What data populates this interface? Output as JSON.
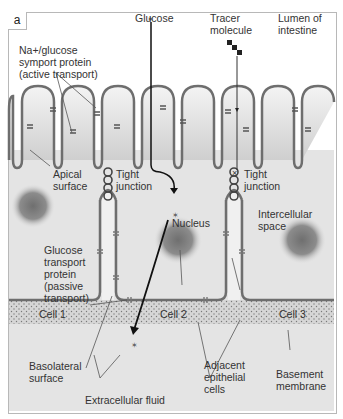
{
  "figure": {
    "panel_label": "a",
    "labels": {
      "symport": "Na+/glucose\nsymport protein\n(active transport)",
      "glucose_top": "Glucose",
      "tracer": "Tracer\nmolecule",
      "lumen": "Lumen of\nintestine",
      "apical": "Apical\nsurface",
      "tight_junction_1": "Tight\njunction",
      "tight_junction_2": "Tight\njunction",
      "nucleus": "Nucleus",
      "intercellular": "Intercellular\nspace",
      "glucose_transport": "Glucose\ntransport\nprotein\n(passive\ntransport)",
      "cell1": "Cell 1",
      "cell2": "Cell 2",
      "cell3": "Cell 3",
      "basolateral": "Basolateral\nsurface",
      "adjacent": "Adjacent\nepithelial\ncells",
      "basement": "Basement\nmembrane",
      "extracellular": "Extracellular fluid"
    },
    "colors": {
      "membrane": "#6e6e6e",
      "cell_fill": "#e6e6e6",
      "nucleus": "#7a7a7a",
      "lumen": "#ffffff",
      "basement": "#d2d2d2"
    }
  }
}
